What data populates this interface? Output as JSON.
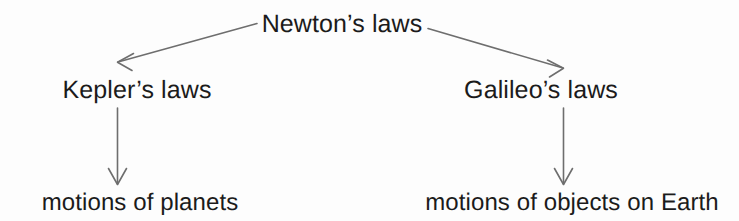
{
  "diagram": {
    "background_color": "#fdfdfd",
    "text_color": "#1b1b1b",
    "line_color": "#6e6e6e",
    "nodes": {
      "root": {
        "label": "Newton’s laws"
      },
      "left_mid": {
        "label": "Kepler’s laws"
      },
      "right_mid": {
        "label": "Galileo’s laws"
      },
      "left_leaf": {
        "label": "motions of planets"
      },
      "right_leaf": {
        "label": "motions of objects on Earth"
      }
    },
    "connectors": [
      {
        "name": "root-to-kepler",
        "from": "root",
        "to": "left_mid",
        "style": "diagonal-arrow",
        "direction": "down-left"
      },
      {
        "name": "root-to-galileo",
        "from": "root",
        "to": "right_mid",
        "style": "diagonal-arrow",
        "direction": "down-right"
      },
      {
        "name": "kepler-to-planets",
        "from": "left_mid",
        "to": "left_leaf",
        "style": "vertical-arrow",
        "direction": "down"
      },
      {
        "name": "galileo-to-earth",
        "from": "right_mid",
        "to": "right_leaf",
        "style": "vertical-arrow",
        "direction": "down"
      }
    ]
  }
}
